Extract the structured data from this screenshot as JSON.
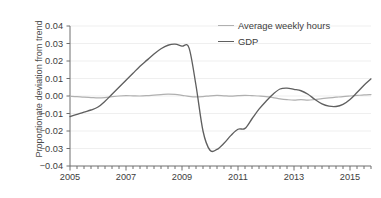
{
  "chart_data": {
    "type": "line",
    "title": "",
    "xlabel": "",
    "ylabel": "Proportionate deviation from trend",
    "xlim": [
      2005.0,
      2015.75
    ],
    "ylim": [
      -0.04,
      0.04
    ],
    "grid": true,
    "legend_position": "top-right",
    "y_ticks": [
      "0.04",
      "0.03",
      "0.02",
      "0.01",
      "0.00",
      "−0.01",
      "−0.02",
      "−0.03",
      "−0.04"
    ],
    "y_tick_values": [
      0.04,
      0.03,
      0.02,
      0.01,
      0.0,
      -0.01,
      -0.02,
      -0.03,
      -0.04
    ],
    "x_ticks": [
      "2005",
      "2007",
      "2009",
      "2011",
      "2013",
      "2015"
    ],
    "x_tick_values": [
      2005,
      2007,
      2009,
      2011,
      2013,
      2015
    ],
    "x_minor_tick_interval": 0.25,
    "colors": {
      "average_weekly_hours": "#b0b0b0",
      "gdp": "#5f5f5f",
      "axis": "#6e6e6e",
      "grid": "#efefef",
      "text": "#3d3d3d"
    },
    "series": [
      {
        "name": "Average weekly hours",
        "color": "#b0b0b0",
        "x": [
          2005.0,
          2005.25,
          2005.5,
          2005.75,
          2006.0,
          2006.25,
          2006.5,
          2006.75,
          2007.0,
          2007.25,
          2007.5,
          2007.75,
          2008.0,
          2008.25,
          2008.5,
          2008.75,
          2009.0,
          2009.25,
          2009.5,
          2009.75,
          2010.0,
          2010.25,
          2010.5,
          2010.75,
          2011.0,
          2011.25,
          2011.5,
          2011.75,
          2012.0,
          2012.25,
          2012.5,
          2012.75,
          2013.0,
          2013.25,
          2013.5,
          2013.75,
          2014.0,
          2014.25,
          2014.5,
          2014.75,
          2015.0,
          2015.25,
          2015.5,
          2015.75
        ],
        "y": [
          -0.0002,
          -0.0004,
          -0.0007,
          -0.0009,
          -0.0011,
          -0.0009,
          -0.0004,
          0.0,
          0.0002,
          0.0001,
          0.0,
          0.0002,
          0.0005,
          0.0008,
          0.0011,
          0.0009,
          0.0004,
          -0.0002,
          -0.0005,
          -0.0003,
          0.0001,
          0.0003,
          0.0001,
          -0.0001,
          0.0002,
          0.0004,
          0.0002,
          0.0,
          -0.0003,
          -0.0009,
          -0.0016,
          -0.0021,
          -0.0024,
          -0.0021,
          -0.0024,
          -0.002,
          -0.0015,
          -0.0011,
          -0.0007,
          -0.0003,
          0.0,
          0.0003,
          0.0006,
          0.0008
        ]
      },
      {
        "name": "GDP",
        "color": "#5f5f5f",
        "x": [
          2005.0,
          2005.25,
          2005.5,
          2005.75,
          2006.0,
          2006.25,
          2006.5,
          2006.75,
          2007.0,
          2007.25,
          2007.5,
          2007.75,
          2008.0,
          2008.25,
          2008.5,
          2008.75,
          2009.0,
          2009.25,
          2009.5,
          2009.75,
          2010.0,
          2010.25,
          2010.5,
          2010.75,
          2011.0,
          2011.25,
          2011.5,
          2011.75,
          2012.0,
          2012.25,
          2012.5,
          2012.75,
          2013.0,
          2013.25,
          2013.5,
          2013.75,
          2014.0,
          2014.25,
          2014.5,
          2014.75,
          2015.0,
          2015.25,
          2015.5,
          2015.75
        ],
        "y": [
          -0.0118,
          -0.0105,
          -0.0092,
          -0.008,
          -0.0063,
          -0.003,
          0.001,
          0.005,
          0.009,
          0.013,
          0.017,
          0.0205,
          0.024,
          0.027,
          0.029,
          0.0296,
          0.0285,
          0.0275,
          0.006,
          -0.02,
          -0.031,
          -0.0305,
          -0.027,
          -0.0225,
          -0.019,
          -0.0185,
          -0.013,
          -0.0075,
          -0.003,
          0.001,
          0.004,
          0.0045,
          0.0038,
          0.003,
          0.001,
          -0.002,
          -0.0045,
          -0.0058,
          -0.006,
          -0.0048,
          -0.002,
          0.002,
          0.0062,
          0.0098
        ]
      }
    ]
  },
  "legend": {
    "items": [
      {
        "label": "Average weekly hours"
      },
      {
        "label": "GDP"
      }
    ]
  }
}
